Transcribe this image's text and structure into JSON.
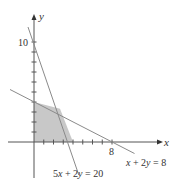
{
  "chart_data": {
    "type": "line",
    "title": "",
    "xlabel": "x",
    "ylabel": "y",
    "xlim": [
      -3.5,
      13.5
    ],
    "ylim": [
      -4.2,
      12.7
    ],
    "x_ticks": [
      1,
      2,
      3,
      4,
      5,
      6,
      7,
      8
    ],
    "y_ticks": [
      1,
      2,
      3,
      4,
      5,
      6,
      7,
      8,
      9,
      10
    ],
    "labeled_ticks": {
      "x": [
        8
      ],
      "y": [
        10
      ]
    },
    "grid": false,
    "series": [
      {
        "name": "x + 2y = 8",
        "equation": "x + 2y = 8",
        "points": [
          [
            -2.5,
            5.25
          ],
          [
            10.3,
            -1.15
          ]
        ]
      },
      {
        "name": "5x + 2y = 20",
        "equation": "5x + 2y = 20",
        "points": [
          [
            -0.6,
            11.5
          ],
          [
            4.6,
            -3.3
          ]
        ]
      }
    ],
    "shaded_region": {
      "description": "feasible region",
      "vertices": [
        [
          0,
          0
        ],
        [
          4,
          0
        ],
        [
          2.667,
          3.333
        ],
        [
          0,
          4
        ]
      ],
      "color": "#c8c8c8"
    },
    "annotations": [
      {
        "text": "x + 2y = 8",
        "position": "below right of line end"
      },
      {
        "text": "5x + 2y = 20",
        "position": "below line end"
      }
    ]
  },
  "labels": {
    "x_axis": "x",
    "y_axis": "y",
    "tick_x8": "8",
    "tick_y10": "10",
    "line1_label": "x + 2y = 8",
    "line2_label": "5x + 2y = 20"
  },
  "colors": {
    "axis": "#555555",
    "line": "#8a8a8a",
    "shade": "#c8c8c8",
    "text": "#333333"
  }
}
